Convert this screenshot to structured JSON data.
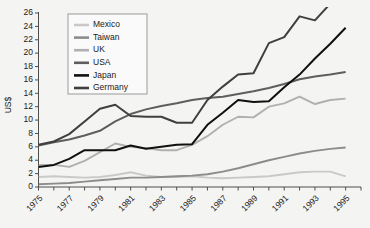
{
  "chart_data": {
    "type": "line",
    "title": "",
    "xlabel": "",
    "ylabel": "US$",
    "ylim": [
      0,
      26
    ],
    "ytick_step": 2,
    "yticks": [
      0,
      2,
      4,
      6,
      8,
      10,
      12,
      14,
      16,
      18,
      20,
      22,
      24,
      26
    ],
    "xlim": [
      1975,
      1996
    ],
    "x": [
      1975,
      1976,
      1977,
      1978,
      1979,
      1980,
      1981,
      1982,
      1983,
      1984,
      1985,
      1986,
      1987,
      1988,
      1989,
      1990,
      1991,
      1992,
      1993,
      1994,
      1995
    ],
    "xticks_labeled": [
      "1975",
      "1977",
      "1979",
      "1981",
      "1983",
      "1985",
      "1987",
      "1989",
      "1991",
      "1993",
      "1995"
    ],
    "xtick_label_rotation": -45,
    "grid": false,
    "legend_position": "top-left-inside",
    "series": [
      {
        "name": "Mexico",
        "color": "#c9c9c9",
        "values": [
          1.5,
          1.6,
          1.5,
          1.4,
          1.5,
          1.8,
          2.2,
          1.7,
          1.5,
          1.5,
          1.6,
          1.4,
          1.3,
          1.4,
          1.5,
          1.6,
          1.9,
          2.2,
          2.3,
          2.3,
          1.6
        ]
      },
      {
        "name": "Taiwan",
        "color": "#8c8c8c",
        "values": [
          0.4,
          0.5,
          0.6,
          0.8,
          1.0,
          1.2,
          1.4,
          1.4,
          1.5,
          1.6,
          1.7,
          1.9,
          2.3,
          2.8,
          3.4,
          4.0,
          4.5,
          5.0,
          5.4,
          5.7,
          5.9
        ]
      },
      {
        "name": "UK",
        "color": "#b0b0b0",
        "values": [
          3.3,
          3.3,
          3.0,
          3.9,
          5.2,
          6.5,
          6.0,
          5.8,
          5.5,
          5.5,
          6.3,
          7.6,
          9.3,
          10.5,
          10.4,
          12.0,
          12.5,
          13.5,
          12.4,
          13.0,
          13.2
        ]
      },
      {
        "name": "USA",
        "color": "#5e5e5e",
        "values": [
          6.2,
          6.7,
          7.1,
          7.7,
          8.4,
          9.8,
          10.9,
          11.6,
          12.1,
          12.5,
          13.0,
          13.3,
          13.5,
          13.9,
          14.3,
          14.8,
          15.4,
          16.1,
          16.5,
          16.8,
          17.2
        ]
      },
      {
        "name": "Japan",
        "color": "#101010",
        "values": [
          3.0,
          3.3,
          4.2,
          5.5,
          5.5,
          5.5,
          6.2,
          5.7,
          6.0,
          6.3,
          6.4,
          9.3,
          11.1,
          13.0,
          12.7,
          12.8,
          14.9,
          16.8,
          19.2,
          21.4,
          23.8
        ]
      },
      {
        "name": "Germany",
        "color": "#3f3f3f",
        "values": [
          6.3,
          6.8,
          7.9,
          9.8,
          11.7,
          12.3,
          10.6,
          10.5,
          10.5,
          9.6,
          9.6,
          13.0,
          15.0,
          16.8,
          17.0,
          21.5,
          22.4,
          25.5,
          24.9,
          27.4,
          31.0
        ]
      }
    ]
  },
  "axis": {
    "y_title": "US$"
  },
  "legend": {
    "entries": [
      {
        "label": "Mexico"
      },
      {
        "label": "Taiwan"
      },
      {
        "label": "UK"
      },
      {
        "label": "USA"
      },
      {
        "label": "Japan"
      },
      {
        "label": "Germany"
      }
    ]
  }
}
